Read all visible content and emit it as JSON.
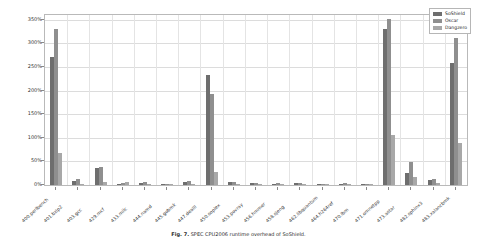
{
  "chart_data": {
    "type": "bar",
    "title": "",
    "xlabel": "",
    "ylabel": "Runtime overhead",
    "ylim": [
      0,
      360
    ],
    "yticks": [
      "0%",
      "50%",
      "100%",
      "150%",
      "200%",
      "250%",
      "300%",
      "350%"
    ],
    "ytick_values": [
      0,
      50,
      100,
      150,
      200,
      250,
      300,
      350
    ],
    "grid": true,
    "legend_position": "upper right",
    "categories": [
      "400.perlbench",
      "401.bzip2",
      "403.gcc",
      "429.mcf",
      "433.milc",
      "444.namd",
      "445.gobmk",
      "447.dealII",
      "450.soplex",
      "453.povray",
      "456.hmmer",
      "458.sjeng",
      "462.libquantum",
      "464.h264ref",
      "470.lbm",
      "471.omnetpp",
      "473.astar",
      "482.sphinx3",
      "483.xalancbmk"
    ],
    "series": [
      {
        "name": "SoShield",
        "color": "#6e6e6e",
        "values": [
          272,
          8,
          35,
          2,
          5,
          1,
          7,
          232,
          6,
          4,
          3,
          4,
          2,
          3,
          1,
          330,
          25,
          10,
          258
        ]
      },
      {
        "name": "Oscar",
        "color": "#8f8f8f",
        "values": [
          330,
          12,
          38,
          4,
          6,
          2,
          9,
          192,
          7,
          5,
          4,
          5,
          3,
          4,
          2,
          352,
          48,
          12,
          312
        ]
      },
      {
        "name": "Dangzero",
        "color": "#a8a8a8",
        "values": [
          68,
          3,
          6,
          6,
          2,
          1,
          3,
          27,
          3,
          2,
          2,
          2,
          2,
          2,
          1,
          105,
          17,
          5,
          88
        ]
      }
    ]
  },
  "legend": {
    "entries": [
      "SoShield",
      "Oscar",
      "Dangzero"
    ]
  },
  "caption": {
    "label": "Fig. 7.",
    "text": "SPEC CPU2006 runtime overhead of SoShield."
  }
}
